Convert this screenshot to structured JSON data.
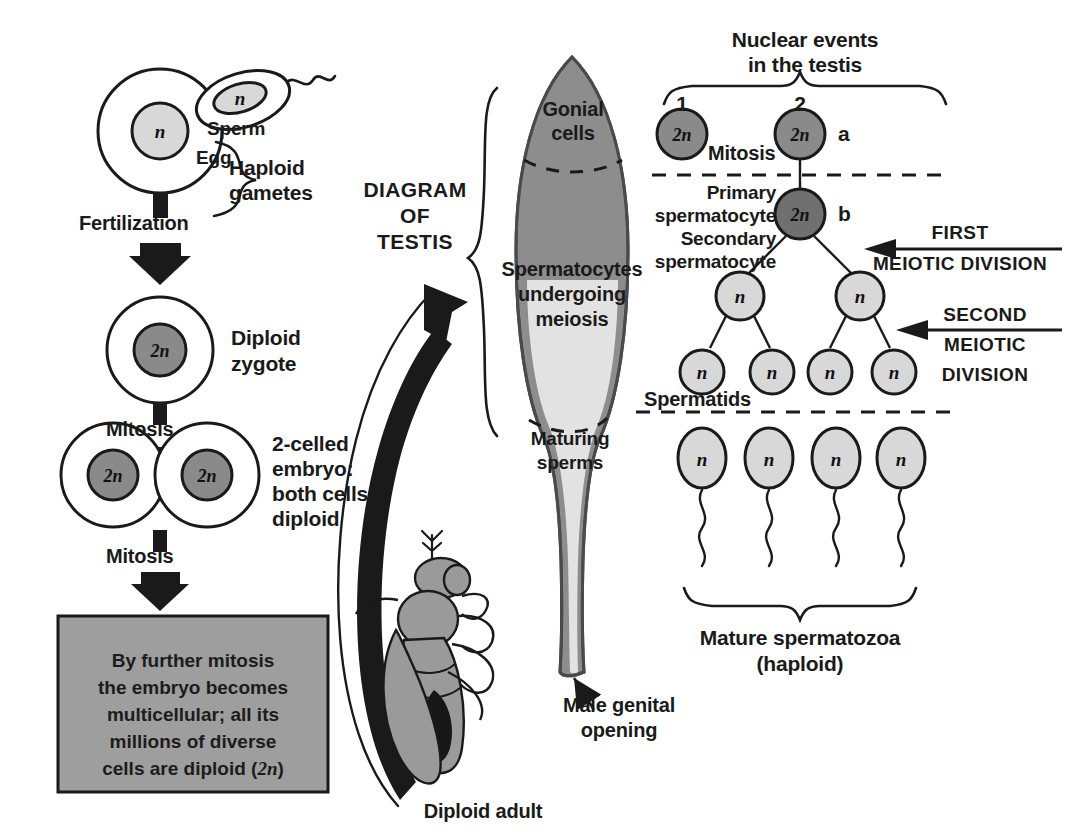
{
  "figure": {
    "background": "#ffffff"
  },
  "colors": {
    "diploid_nucleus": "#8a8a8a",
    "haploid_nucleus": "#d8d8d8",
    "testis_outer": "#8d8d8d",
    "testis_lumen": "#e2e2e2",
    "fly_body": "#9a9a9a",
    "text_box_fill": "#9e9e9e",
    "outline": "#1a1a1a"
  },
  "left_column": {
    "gametes": {
      "egg_label": "Egg",
      "sperm_label": "Sperm",
      "egg_nucleus": "n",
      "sperm_nucleus": "n",
      "group_label_line1": "Haploid",
      "group_label_line2": "gametes"
    },
    "step1_arrow_label": "Fertilization",
    "zygote": {
      "nucleus": "2n",
      "label_line1": "Diploid",
      "label_line2": "zygote"
    },
    "step2_arrow_label": "Mitosis",
    "embryo": {
      "cell1_nucleus": "2n",
      "cell2_nucleus": "2n",
      "label_line1": "2-celled",
      "label_line2": "embryo:",
      "label_line3": "both cells",
      "label_line4": "diploid"
    },
    "step3_arrow_label": "Mitosis",
    "summary_box": {
      "line1": "By further mitosis",
      "line2": "the embryo becomes",
      "line3": "multicellular; all its",
      "line4": "millions of diverse",
      "line5_pre": "cells are diploid (",
      "line5_italic": "2n",
      "line5_post": ")"
    }
  },
  "center_column": {
    "diagram_label_line1": "DIAGRAM",
    "diagram_label_line2": "OF",
    "diagram_label_line3": "TESTIS",
    "testis_zones": {
      "gonial_line1": "Gonial",
      "gonial_line2": "cells",
      "spermatocytes_line1": "Spermatocytes",
      "spermatocytes_line2": "undergoing",
      "spermatocytes_line3": "meiosis",
      "maturing_line1": "Maturing",
      "maturing_line2": "sperms"
    },
    "genital_opening_line1": "Male genital",
    "genital_opening_line2": "opening",
    "adult_label": "Diploid adult"
  },
  "right_column": {
    "header_line1": "Nuclear events",
    "header_line2": "in the testis",
    "stage_numbers": [
      "1",
      "2"
    ],
    "mitosis_label": "Mitosis",
    "row_letters": [
      "a",
      "b"
    ],
    "cells": {
      "mitosis_left": "2n",
      "mitosis_right": "2n",
      "primary_spermatocyte": "2n",
      "secondary_spermatocytes": [
        "n",
        "n"
      ],
      "spermatids": [
        "n",
        "n",
        "n",
        "n"
      ],
      "spermatozoa": [
        "n",
        "n",
        "n",
        "n"
      ]
    },
    "labels": {
      "primary_line1": "Primary",
      "primary_line2": "spermatocyte",
      "secondary_line1": "Secondary",
      "secondary_line2": "spermatocyte",
      "spermatids": "Spermatids"
    },
    "first_division_line1": "FIRST",
    "first_division_line2": "MEIOTIC DIVISION",
    "second_division_line1": "SECOND",
    "second_division_line2": "MEIOTIC",
    "second_division_line3": "DIVISION",
    "mature_line1": "Mature spermatozoa",
    "mature_line2": "(haploid)"
  }
}
